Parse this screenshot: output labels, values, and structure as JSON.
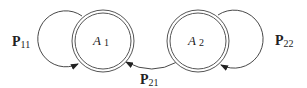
{
  "diagram": {
    "type": "state-transition",
    "states": [
      {
        "id": "A1",
        "label": "A",
        "subscript": "1"
      },
      {
        "id": "A2",
        "label": "A",
        "subscript": "2"
      }
    ],
    "transitions": [
      {
        "from": "A1",
        "to": "A1",
        "label": "P",
        "subscript": "11"
      },
      {
        "from": "A2",
        "to": "A1",
        "label": "P",
        "subscript": "21"
      },
      {
        "from": "A2",
        "to": "A2",
        "label": "P",
        "subscript": "22"
      }
    ],
    "colors": {
      "stroke": "#333333",
      "background": "#ffffff"
    }
  }
}
